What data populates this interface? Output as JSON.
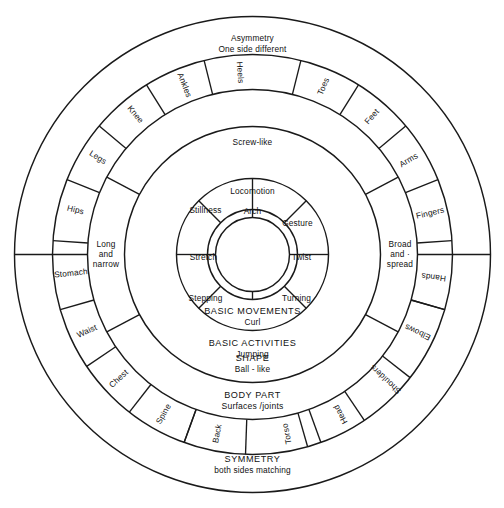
{
  "diagram": {
    "geometry": {
      "cx": 252.5,
      "cy": 254.5,
      "radii": {
        "outer": 238,
        "r2": 200,
        "r3": 165,
        "r4": 128,
        "r5": 76,
        "r6": 45,
        "core": 37
      },
      "stroke_color": "#1a1a1a",
      "background": "#ffffff"
    },
    "core": {
      "label": "ACTION"
    },
    "ring_movements": {
      "band_label_line1": "BASIC MOVEMENTS",
      "band_label_line2": "Curl",
      "segments": [
        {
          "label": "Arch",
          "angle": 90
        },
        {
          "label": "Twist",
          "angle": 0
        },
        {
          "label": "Stretch",
          "angle": 180
        }
      ]
    },
    "ring_activities": {
      "band_label_line1": "BASIC ACTIVITIES",
      "band_label_line2": "Jumping",
      "segments": [
        {
          "label": "Locomotion",
          "angle": 90
        },
        {
          "label": "Gesture",
          "angle": 40
        },
        {
          "label": "Turning",
          "angle": -22
        },
        {
          "label": "Stepping",
          "angle": 202
        },
        {
          "label": "Stillness",
          "angle": 140
        }
      ]
    },
    "ring_shape": {
      "band_label_top": "Screw-like",
      "band_label_line1": "SHAPE",
      "band_label_line2": "Ball - like"
    },
    "ring_bodypart": {
      "band_label_line1": "BODY PART",
      "band_label_line2": "Surfaces /joints",
      "segments": [
        {
          "label": "Heels"
        },
        {
          "label": "Ankles"
        },
        {
          "label": "Knee"
        },
        {
          "label": "Legs"
        },
        {
          "label": "Hips"
        },
        {
          "label": "Stomach"
        },
        {
          "label": "Waist"
        },
        {
          "label": "Chest"
        },
        {
          "label": "Spine"
        },
        {
          "label": "Back"
        },
        {
          "label": "Torso"
        },
        {
          "label": "Head"
        },
        {
          "label": "Shoulders"
        },
        {
          "label": "Elbows"
        },
        {
          "label": "Hands"
        },
        {
          "label": "Fingers"
        },
        {
          "label": "Arms"
        },
        {
          "label": "Feet"
        },
        {
          "label": "Toes"
        }
      ]
    },
    "ring_inner_bodypart": {
      "left_label_line1": "Long",
      "left_label_line2": "and",
      "left_label_line3": "narrow",
      "right_label_line1": "Broad",
      "right_label_line2": "and ·",
      "right_label_line3": "spread"
    },
    "ring_symmetry": {
      "top_label_line1": "Asymmetry",
      "top_label_line2": "One side different",
      "bottom_label_line1": "SYMMETRY",
      "bottom_label_line2": "both sides matching"
    }
  }
}
